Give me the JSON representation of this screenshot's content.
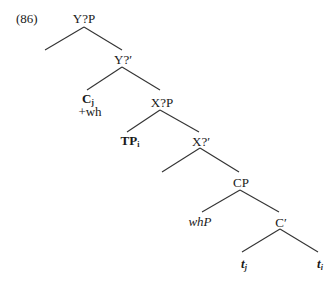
{
  "example_number": "(86)",
  "nodes": {
    "root": "Y?P",
    "ybar": "Y?′",
    "c_head": "C",
    "c_head_sub": "j",
    "c_feature": "+wh",
    "xp": "X?P",
    "tp": "TP",
    "tp_sub": "i",
    "xbar": "X?′",
    "cp": "CP",
    "whp": "whP",
    "cbar": "C′",
    "trace_j": "t",
    "trace_j_sub": "j",
    "trace_i": "t",
    "trace_i_sub": "i"
  },
  "colors": {
    "line": "#333333",
    "text": "#1a1a1a"
  }
}
